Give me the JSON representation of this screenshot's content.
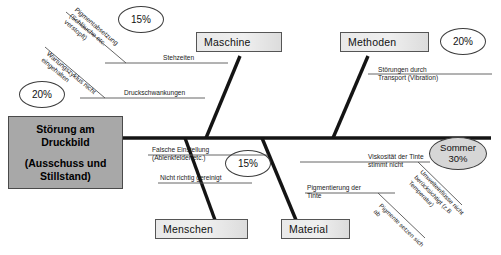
{
  "diagram": {
    "type": "fishbone-ishikawa",
    "language": "de",
    "head": {
      "line1": "Störung am",
      "line2": "Druckbild",
      "line3": "(Ausschuss und",
      "line4": "Stillstand)"
    },
    "categories": [
      {
        "id": "maschine",
        "label": "Maschine",
        "position": "top-left"
      },
      {
        "id": "methoden",
        "label": "Methoden",
        "position": "top-right"
      },
      {
        "id": "menschen",
        "label": "Menschen",
        "position": "bottom-left"
      },
      {
        "id": "material",
        "label": "Material",
        "position": "bottom-right"
      }
    ],
    "causes": {
      "maschine": [
        {
          "id": "stehzeiten",
          "text": "Stehzeiten"
        },
        {
          "id": "druckschwankungen",
          "text": "Druckschwankungen"
        },
        {
          "id": "pigmentabsetzung",
          "text": "Pigmentabsetzung (Schläuche etc. verstopft)",
          "line1": "Pigmentabsetzung",
          "line2": "(Schläuche etc.",
          "line3": "verstopft)",
          "rotated": true
        },
        {
          "id": "wartungszyklus",
          "text": "Wartungszyklus nicht eingehalten",
          "line1": "Wartungszyklus nicht",
          "line2": "eingehalten",
          "rotated": true
        }
      ],
      "methoden": [
        {
          "id": "transport",
          "line1": "Störungen durch",
          "line2": "Transport (Vibration)"
        }
      ],
      "menschen": [
        {
          "id": "falsche-einstellung",
          "line1": "Falsche  Einstellung",
          "line2": "(Ablenkfelder etc.)"
        },
        {
          "id": "nicht-gereinigt",
          "line1": "Nicht richtig gereinigt"
        }
      ],
      "material": [
        {
          "id": "viskositaet",
          "line1": "Viskosität der Tinte",
          "line2": "stimmt nicht"
        },
        {
          "id": "pigmentierung",
          "line1": "Pigmentierung der",
          "line2": "Tinte"
        },
        {
          "id": "umwelteinfluesse",
          "line1": "Umwelteinflüsse nicht",
          "line2": "berücksichtigt (z.B",
          "line3": "Temperatur)",
          "rotated": true
        },
        {
          "id": "pigmente-setzen",
          "line1": "Pigmente setzen sich",
          "line2": "ab",
          "rotated": true
        }
      ]
    },
    "percent_markers": [
      {
        "id": "pct-maschine-top",
        "value": "15%",
        "filled": false
      },
      {
        "id": "pct-maschine-left",
        "value": "20%",
        "filled": false
      },
      {
        "id": "pct-methoden",
        "value": "20%",
        "filled": false
      },
      {
        "id": "pct-menschen",
        "value": "15%",
        "filled": false
      },
      {
        "id": "pct-material",
        "line1": "Sommer",
        "line2": "30%",
        "filled": true
      }
    ],
    "colors": {
      "head_fill": "#a8a8a8",
      "box_fill": "#e9e9e9",
      "oval_fill": "#d6d6d6",
      "line": "#1a1a1a",
      "background": "#ffffff"
    }
  }
}
